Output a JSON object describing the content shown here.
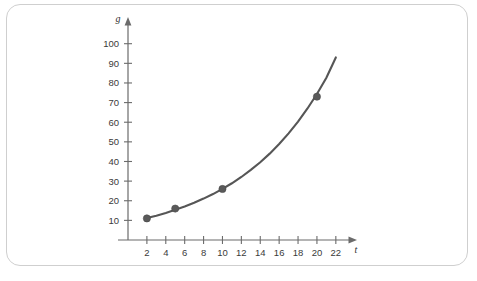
{
  "chart_data": {
    "type": "line",
    "title": "",
    "subtitle": "",
    "xlabel": "t",
    "ylabel": "g",
    "xlim": [
      0,
      23.5
    ],
    "ylim": [
      0,
      108
    ],
    "grid": false,
    "legend": null,
    "xticks": [
      2,
      4,
      6,
      8,
      10,
      12,
      14,
      16,
      18,
      20,
      22
    ],
    "xtick_labels": [
      "2",
      "4",
      "6",
      "8",
      "10",
      "12",
      "14",
      "16",
      "18",
      "20",
      "22"
    ],
    "yticks": [
      10,
      20,
      30,
      40,
      50,
      60,
      70,
      80,
      90,
      100
    ],
    "ytick_labels": [
      "10",
      "20",
      "30",
      "40",
      "50",
      "60",
      "70",
      "80",
      "90",
      "100"
    ],
    "series": [
      {
        "name": "g",
        "kind": "exponential-curve",
        "color": "#565656",
        "x_start": 2,
        "x_end": 22,
        "curve_points": [
          {
            "t": 2,
            "g": 11.2
          },
          {
            "t": 3,
            "g": 12.4
          },
          {
            "t": 4,
            "g": 13.8
          },
          {
            "t": 5,
            "g": 15.4
          },
          {
            "t": 6,
            "g": 17.1
          },
          {
            "t": 7,
            "g": 19.0
          },
          {
            "t": 8,
            "g": 21.1
          },
          {
            "t": 9,
            "g": 23.4
          },
          {
            "t": 10,
            "g": 26.0
          },
          {
            "t": 11,
            "g": 28.9
          },
          {
            "t": 12,
            "g": 32.1
          },
          {
            "t": 13,
            "g": 35.7
          },
          {
            "t": 14,
            "g": 39.6
          },
          {
            "t": 15,
            "g": 44.0
          },
          {
            "t": 16,
            "g": 48.9
          },
          {
            "t": 17,
            "g": 54.3
          },
          {
            "t": 18,
            "g": 60.3
          },
          {
            "t": 19,
            "g": 67.0
          },
          {
            "t": 20,
            "g": 74.4
          },
          {
            "t": 21,
            "g": 82.7
          },
          {
            "t": 22,
            "g": 93.0
          }
        ]
      }
    ],
    "markers": [
      {
        "t": 2,
        "g": 11
      },
      {
        "t": 5,
        "g": 16
      },
      {
        "t": 10,
        "g": 26
      },
      {
        "t": 20,
        "g": 73
      }
    ],
    "colors": {
      "curve": "#565656",
      "marker": "#5a5a5a",
      "axis": "#6b6b6b",
      "tick_text": "#3a3a3a",
      "card_border": "#cfcfcf",
      "background": "#ffffff"
    }
  }
}
